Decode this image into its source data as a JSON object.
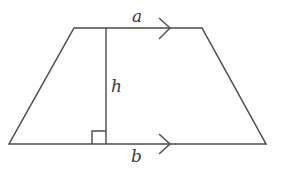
{
  "diagram": {
    "type": "trapezium",
    "labels": {
      "top_side": "a",
      "height": "h",
      "bottom_side": "b"
    },
    "colors": {
      "stroke": "#4a4a4a",
      "background": "#ffffff"
    },
    "vertices": {
      "top_left": [
        74,
        28
      ],
      "top_right": [
        202,
        28
      ],
      "bottom_right": [
        266,
        144
      ],
      "bottom_left": [
        9,
        144
      ]
    },
    "height_line": {
      "x": 106,
      "y1": 28,
      "y2": 144
    },
    "right_angle_marker": {
      "x": 92,
      "y": 131,
      "size": 14
    },
    "parallel_markers": [
      {
        "side": "top",
        "tip": [
          170,
          28
        ]
      },
      {
        "side": "bottom",
        "tip": [
          170,
          144
        ]
      }
    ]
  }
}
